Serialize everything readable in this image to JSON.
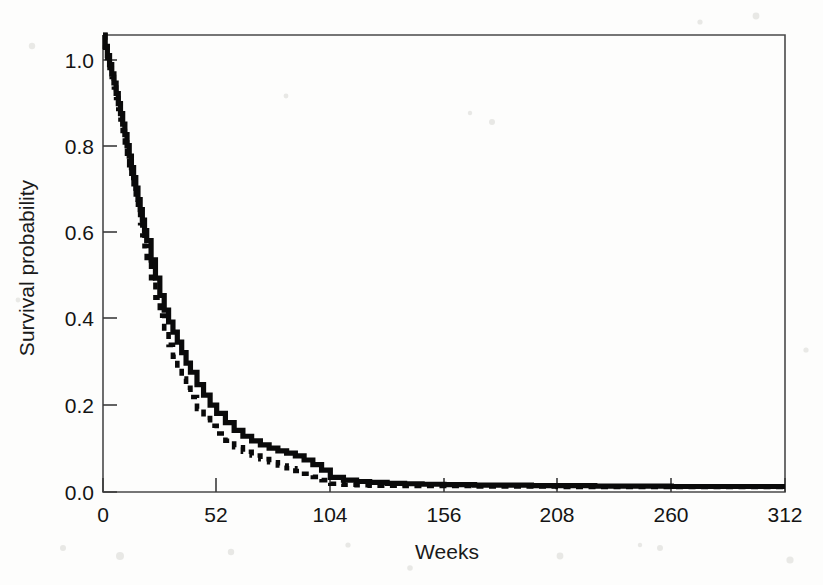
{
  "figure": {
    "kind": "kaplan-meier-survival-plot",
    "background_color": "#fdfdfc",
    "ink_color": "#0a0a0a",
    "frame_color": "#4a4a4a"
  },
  "axes": {
    "x_title": "Weeks",
    "y_title": "Survival probability",
    "x_ticks": [
      "0",
      "52",
      "104",
      "156",
      "208",
      "260",
      "312"
    ],
    "y_ticks": [
      "0.0",
      "0.2",
      "0.4",
      "0.6",
      "0.8",
      "1.0"
    ]
  },
  "chart_data": {
    "type": "line",
    "title": "",
    "xlabel": "Weeks",
    "ylabel": "Survival probability",
    "xlim": [
      0,
      312
    ],
    "ylim": [
      0.0,
      1.0
    ],
    "xticks": [
      0,
      52,
      104,
      156,
      208,
      260,
      312
    ],
    "yticks": [
      0.0,
      0.2,
      0.4,
      0.6,
      0.8,
      1.0
    ],
    "grid": false,
    "legend": "none",
    "step": "post",
    "series": [
      {
        "name": "solid-curve",
        "style": "solid",
        "x": [
          0,
          1,
          2,
          3,
          4,
          5,
          6,
          7,
          8,
          9,
          10,
          11,
          12,
          13,
          14,
          15,
          16,
          17,
          18,
          19,
          20,
          22,
          24,
          26,
          28,
          30,
          32,
          34,
          36,
          38,
          40,
          43,
          46,
          49,
          52,
          56,
          60,
          64,
          68,
          72,
          76,
          80,
          84,
          88,
          92,
          96,
          100,
          104,
          110,
          116,
          122,
          130,
          138,
          146,
          156,
          170,
          182,
          196,
          208,
          225,
          240,
          260,
          280,
          300,
          312
        ],
        "y": [
          1.0,
          0.975,
          0.955,
          0.935,
          0.915,
          0.895,
          0.872,
          0.85,
          0.828,
          0.805,
          0.782,
          0.758,
          0.735,
          0.71,
          0.688,
          0.665,
          0.64,
          0.618,
          0.595,
          0.572,
          0.55,
          0.508,
          0.468,
          0.43,
          0.398,
          0.372,
          0.35,
          0.328,
          0.305,
          0.282,
          0.262,
          0.235,
          0.212,
          0.19,
          0.172,
          0.152,
          0.135,
          0.122,
          0.112,
          0.103,
          0.096,
          0.09,
          0.085,
          0.079,
          0.07,
          0.06,
          0.048,
          0.032,
          0.026,
          0.023,
          0.021,
          0.019,
          0.018,
          0.017,
          0.016,
          0.015,
          0.015,
          0.014,
          0.014,
          0.013,
          0.013,
          0.012,
          0.012,
          0.012,
          0.012
        ]
      },
      {
        "name": "dashed-curve",
        "style": "dashed",
        "x": [
          0,
          1,
          2,
          3,
          4,
          5,
          6,
          7,
          8,
          9,
          10,
          11,
          12,
          13,
          14,
          15,
          16,
          17,
          18,
          19,
          20,
          22,
          24,
          26,
          28,
          30,
          32,
          34,
          36,
          38,
          40,
          43,
          46,
          49,
          52,
          56,
          60,
          64,
          68,
          72,
          76,
          80,
          84,
          88,
          92,
          96,
          100,
          104,
          110,
          116,
          122,
          130,
          138,
          146,
          156,
          170,
          182,
          196,
          208,
          225,
          240,
          260,
          280,
          300,
          312
        ],
        "y": [
          1.0,
          0.972,
          0.95,
          0.928,
          0.908,
          0.885,
          0.862,
          0.838,
          0.815,
          0.79,
          0.765,
          0.74,
          0.715,
          0.688,
          0.662,
          0.638,
          0.612,
          0.588,
          0.562,
          0.538,
          0.512,
          0.468,
          0.425,
          0.386,
          0.352,
          0.322,
          0.296,
          0.272,
          0.248,
          0.228,
          0.208,
          0.182,
          0.162,
          0.145,
          0.128,
          0.112,
          0.098,
          0.088,
          0.08,
          0.072,
          0.065,
          0.058,
          0.052,
          0.046,
          0.04,
          0.033,
          0.026,
          0.018,
          0.016,
          0.015,
          0.014,
          0.014,
          0.013,
          0.013,
          0.013,
          0.012,
          0.012,
          0.012,
          0.011,
          0.011,
          0.011,
          0.011,
          0.011,
          0.011,
          0.011
        ]
      }
    ]
  }
}
